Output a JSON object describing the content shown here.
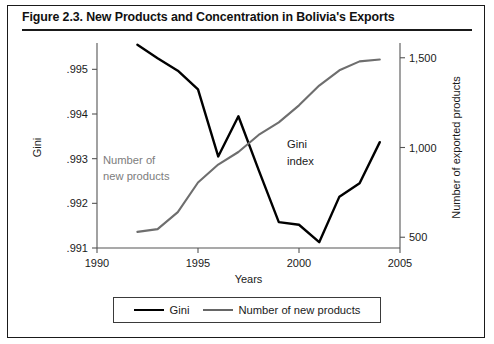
{
  "figure": {
    "title": "Figure 2.3. New Products and Concentration in Bolivia's Exports"
  },
  "annotations": {
    "new_products_line1": "Number of",
    "new_products_line2": "new products",
    "gini_line1": "Gini",
    "gini_line2": "index"
  },
  "legend": {
    "items": [
      {
        "label": "Gini",
        "color": "#000000"
      },
      {
        "label": "Number of new products",
        "color": "#666666"
      }
    ]
  },
  "chart_data": {
    "type": "line",
    "title": "Figure 2.3. New Products and Concentration in Bolivia's Exports",
    "xlabel": "Years",
    "ylabel": "Gini",
    "y2label": "Number of exported products",
    "xlim": [
      1990,
      2005
    ],
    "ylim": [
      0.991,
      0.9955
    ],
    "y2lim": [
      440,
      1560
    ],
    "xticks": [
      1990,
      1995,
      2000,
      2005
    ],
    "xticklabels": [
      "1990",
      "1995",
      "2000",
      "2005"
    ],
    "yticks": [
      0.991,
      0.992,
      0.993,
      0.994,
      0.995
    ],
    "yticklabels": [
      ".991",
      ".992",
      ".993",
      ".994",
      ".995"
    ],
    "y2ticks": [
      500,
      1000,
      1500
    ],
    "y2ticklabels": [
      "500",
      "1,000",
      "1,500"
    ],
    "grid": false,
    "legend_position": "bottom",
    "series": [
      {
        "name": "Gini",
        "axis": "left",
        "color": "#000000",
        "x": [
          1992,
          1993,
          1994,
          1995,
          1996,
          1997,
          1998,
          1999,
          2000,
          2001,
          2002,
          2003,
          2004
        ],
        "values": [
          0.99555,
          0.99525,
          0.99497,
          0.99455,
          0.99305,
          0.99395,
          0.99275,
          0.99158,
          0.99152,
          0.99113,
          0.99215,
          0.99245,
          0.99337
        ]
      },
      {
        "name": "Number of new products",
        "axis": "right",
        "color": "#6e6e6e",
        "x": [
          1992,
          1993,
          1994,
          1995,
          1996,
          1997,
          1998,
          1999,
          2000,
          2001,
          2002,
          2003,
          2004
        ],
        "values": [
          530,
          545,
          640,
          805,
          905,
          975,
          1070,
          1140,
          1235,
          1345,
          1430,
          1480,
          1490
        ]
      }
    ]
  }
}
